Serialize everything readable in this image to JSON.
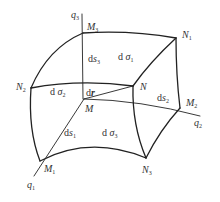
{
  "figure": {
    "axes": {
      "q1": {
        "label": "q",
        "sub": "1"
      },
      "q2": {
        "label": "q",
        "sub": "2"
      },
      "q3": {
        "label": "q",
        "sub": "3"
      }
    },
    "points": {
      "M": {
        "label": "M",
        "sub": ""
      },
      "M1": {
        "label": "M",
        "sub": "1"
      },
      "M2": {
        "label": "M",
        "sub": "2"
      },
      "M3": {
        "label": "M",
        "sub": "3"
      },
      "N": {
        "label": "N",
        "sub": ""
      },
      "N1": {
        "label": "N",
        "sub": "1"
      },
      "N2": {
        "label": "N",
        "sub": "2"
      },
      "N3": {
        "label": "N",
        "sub": "3"
      }
    },
    "elements": {
      "ds1": {
        "prefix": "d",
        "var": "s",
        "sub": "1"
      },
      "ds2": {
        "prefix": "d",
        "var": "s",
        "sub": "2"
      },
      "ds3": {
        "prefix": "d",
        "var": "s",
        "sub": "3"
      },
      "dsigma1": {
        "prefix": "d",
        "var": "σ",
        "sub": "1"
      },
      "dsigma2": {
        "prefix": "d",
        "var": "σ",
        "sub": "2"
      },
      "dsigma3": {
        "prefix": "d",
        "var": "σ",
        "sub": "3"
      },
      "dr": {
        "prefix": "d",
        "var": "r",
        "sub": ""
      }
    },
    "colors": {
      "stroke": "#222222",
      "text": "#333333"
    }
  }
}
